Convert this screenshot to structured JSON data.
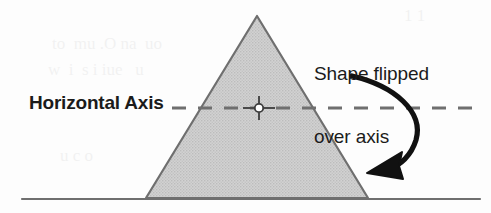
{
  "figure": {
    "type": "geometry-diagram",
    "width": 491,
    "height": 213,
    "background_color": "#fdfdfd"
  },
  "labels": {
    "axis_label": "Horizontal Axis",
    "callout_line1": "Shape flipped",
    "callout_line2": "over axis"
  },
  "colors": {
    "ink": "#1b1b1b",
    "shape_fill": "#c9c9c9",
    "shape_stroke": "#6f6f6f",
    "axis_dash": "#6f6f6f",
    "ground_line": "#6f6f6f",
    "arrow": "#111111"
  },
  "shape": {
    "name": "triangle",
    "apex_x": 257,
    "apex_y": 16,
    "base_left_x": 146,
    "base_right_x": 368,
    "base_y": 198,
    "fill": "#c9c9c9",
    "stroke": "#6f6f6f"
  },
  "axis": {
    "name": "horizontal-axis",
    "y": 108,
    "x_start": 172,
    "x_end": 474,
    "dash_length": 14,
    "dash_gap": 12,
    "style": "dashed"
  },
  "center_marker": {
    "x": 259,
    "y": 108,
    "radius": 4
  },
  "ground_line": {
    "y": 199,
    "x_start": 22,
    "x_end": 480
  },
  "arrow": {
    "name": "flip-arrow",
    "start_x": 352,
    "start_y": 76,
    "end_x": 378,
    "end_y": 168,
    "direction": "clockwise-down-left"
  },
  "ghost_text": {
    "line1": "to  mu .O na  uo",
    "line2": "w  i  s i iue   u",
    "line3": "u c o",
    "line4": "1 1"
  }
}
